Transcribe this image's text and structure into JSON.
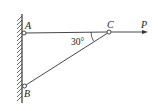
{
  "diagram": {
    "title": "",
    "points": {
      "A": {
        "label": "A",
        "x": 23,
        "y": 33
      },
      "B": {
        "label": "B",
        "x": 24,
        "y": 86
      },
      "C": {
        "label": "C",
        "x": 109,
        "y": 32
      }
    },
    "members": [
      {
        "name": "AC",
        "from": "A",
        "to": "C"
      },
      {
        "name": "BC",
        "from": "B",
        "to": "C"
      }
    ],
    "angle": {
      "label": "30°",
      "at": "C",
      "between": [
        "CA",
        "CB"
      ]
    },
    "force": {
      "label": "P",
      "at": "C",
      "direction": "right"
    },
    "support": {
      "type": "fixed wall",
      "side": "left"
    },
    "colors": {
      "line": "#333333",
      "background": "#ffffff"
    }
  }
}
